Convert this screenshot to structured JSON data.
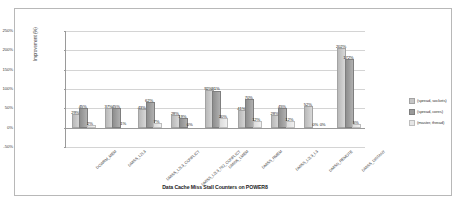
{
  "chart_data": {
    "type": "bar",
    "title": "Data Cache Miss Stall Counters on POWER8",
    "xlabel": "",
    "ylabel": "Improvement (%)",
    "ylim": [
      -50,
      250
    ],
    "yticks": [
      "-50%",
      "0%",
      "50%",
      "100%",
      "150%",
      "200%",
      "250%"
    ],
    "grid": true,
    "legend_position": "right",
    "categories": [
      "DCWRM_MEM",
      "DMISS_L2L3",
      "DMISS_L2L3_CONFLICT",
      "DMISS_L2L3_NO_CONFLICT",
      "DMISS_LMEM",
      "DMISS_RMEM",
      "DMISS_L2L3_L3",
      "DMISS_REMOTE",
      "DMISS_DISTANT"
    ],
    "series": [
      {
        "name": "(spread, sockets)",
        "color": "#c6c6c6",
        "values": [
          29,
          45,
          43,
          28,
          92,
          41,
          28,
          52,
          202
        ],
        "labels": [
          "29%",
          "37%",
          "43%",
          "28%",
          "92%",
          "41%",
          "28%",
          "52%",
          "202%"
        ]
      },
      {
        "name": "(spread, cores)",
        "color": "#9a9a9a",
        "values": [
          45,
          45,
          62,
          19,
          91,
          70,
          45,
          0,
          172
        ],
        "labels": [
          "45%",
          "45%",
          "62%",
          "19%",
          "91%",
          "70%",
          "45%",
          "0%",
          "172%"
        ]
      },
      {
        "name": "(master, thread)",
        "color": "#e6e6e6",
        "values": [
          2,
          1,
          7,
          0,
          20,
          12,
          12,
          0,
          5
        ],
        "labels": [
          "2%",
          "1%",
          "7%",
          "0%",
          "20%",
          "12%",
          "12%",
          "0%",
          "5%"
        ]
      }
    ]
  },
  "legend": {
    "items": [
      {
        "label": "(spread, sockets)"
      },
      {
        "label": "(spread, cores)"
      },
      {
        "label": "(master, thread)"
      }
    ]
  }
}
